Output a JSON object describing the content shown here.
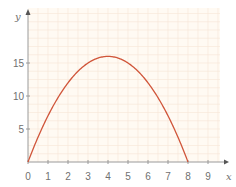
{
  "chart_data": {
    "type": "line",
    "title": "",
    "xlabel": "x",
    "ylabel": "y",
    "xlim": [
      0,
      9.5
    ],
    "ylim": [
      0,
      17.5
    ],
    "x_ticks": [
      0,
      1,
      2,
      3,
      4,
      5,
      6,
      7,
      8,
      9
    ],
    "x_tick_labels": [
      "0",
      "1",
      "2",
      "3",
      "4",
      "5",
      "6",
      "7",
      "8",
      "9"
    ],
    "y_ticks": [
      5,
      10,
      15
    ],
    "y_tick_labels": [
      "5",
      "10",
      "15"
    ],
    "grid": true,
    "legend": null,
    "series": [
      {
        "name": "y = 8x - x²",
        "color": "#d0553a",
        "x": [
          0,
          0.5,
          1,
          1.5,
          2,
          2.5,
          3,
          3.5,
          4,
          4.5,
          5,
          5.5,
          6,
          6.5,
          7,
          7.5,
          8
        ],
        "y": [
          0,
          3.75,
          7,
          9.75,
          12,
          13.75,
          15,
          15.75,
          16,
          15.75,
          15,
          13.75,
          12,
          9.75,
          7,
          3.75,
          0
        ]
      }
    ]
  },
  "colors": {
    "plot_background": "#fffaf3",
    "grid": "#f7e6d6",
    "axis": "#9a9a9a",
    "curve": "#d0553a",
    "text": "#707070"
  }
}
